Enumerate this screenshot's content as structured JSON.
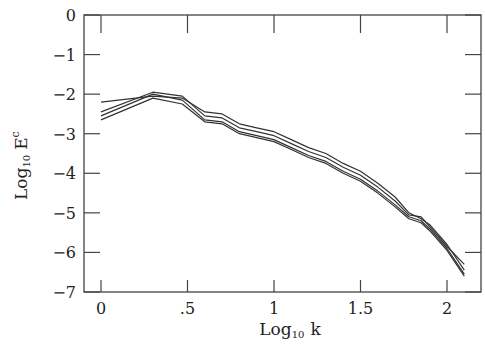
{
  "chart_data": {
    "type": "line",
    "title": "",
    "xlabel": "Log₁₀ k",
    "ylabel": "Log₁₀ E^c",
    "xlabel_main": "Log",
    "xlabel_sub": "10",
    "xlabel_var": "k",
    "ylabel_main": "Log",
    "ylabel_sub": "10",
    "ylabel_var": "E",
    "ylabel_sup": "c",
    "xlim": [
      -0.1,
      2.19
    ],
    "ylim": [
      -7,
      0
    ],
    "xticks": [
      0,
      0.5,
      1,
      1.5,
      2
    ],
    "xtick_labels": [
      "0",
      ".5",
      "1",
      "1.5",
      "2"
    ],
    "yticks": [
      0,
      -1,
      -2,
      -3,
      -4,
      -5,
      -6,
      -7
    ],
    "ytick_labels": [
      "0",
      "-1",
      "-2",
      "-3",
      "-4",
      "-5",
      "-6",
      "-7"
    ],
    "grid": false,
    "legend": null,
    "series": [
      {
        "name": "curve-1",
        "x": [
          0,
          0.3,
          0.47,
          0.6,
          0.7,
          0.8,
          0.9,
          1.0,
          1.1,
          1.2,
          1.3,
          1.4,
          1.5,
          1.6,
          1.7,
          1.78,
          1.85,
          1.9,
          2.0,
          2.1
        ],
        "y": [
          -2.2,
          -2.05,
          -2.1,
          -2.45,
          -2.5,
          -2.75,
          -2.85,
          -2.95,
          -3.15,
          -3.35,
          -3.5,
          -3.75,
          -3.95,
          -4.25,
          -4.6,
          -5.0,
          -5.15,
          -5.3,
          -5.8,
          -6.45
        ]
      },
      {
        "name": "curve-2",
        "x": [
          0,
          0.3,
          0.47,
          0.6,
          0.7,
          0.8,
          0.9,
          1.0,
          1.1,
          1.2,
          1.3,
          1.4,
          1.5,
          1.6,
          1.7,
          1.78,
          1.85,
          1.9,
          2.0,
          2.1
        ],
        "y": [
          -2.45,
          -1.95,
          -2.05,
          -2.55,
          -2.6,
          -2.85,
          -2.95,
          -3.05,
          -3.25,
          -3.45,
          -3.6,
          -3.85,
          -4.05,
          -4.35,
          -4.7,
          -5.05,
          -5.1,
          -5.35,
          -5.85,
          -6.3
        ]
      },
      {
        "name": "curve-3",
        "x": [
          0,
          0.3,
          0.47,
          0.6,
          0.7,
          0.8,
          0.9,
          1.0,
          1.1,
          1.2,
          1.3,
          1.4,
          1.5,
          1.6,
          1.7,
          1.78,
          1.85,
          1.9,
          2.0,
          2.1
        ],
        "y": [
          -2.55,
          -2.0,
          -2.15,
          -2.65,
          -2.7,
          -2.95,
          -3.05,
          -3.15,
          -3.35,
          -3.55,
          -3.7,
          -3.95,
          -4.15,
          -4.45,
          -4.8,
          -5.1,
          -5.2,
          -5.4,
          -5.9,
          -6.55
        ]
      },
      {
        "name": "curve-4",
        "x": [
          0,
          0.3,
          0.47,
          0.6,
          0.7,
          0.8,
          0.9,
          1.0,
          1.1,
          1.2,
          1.3,
          1.4,
          1.5,
          1.6,
          1.7,
          1.78,
          1.85,
          1.9,
          2.0,
          2.1
        ],
        "y": [
          -2.65,
          -2.1,
          -2.25,
          -2.7,
          -2.75,
          -3.0,
          -3.1,
          -3.2,
          -3.4,
          -3.6,
          -3.75,
          -4.0,
          -4.2,
          -4.5,
          -4.85,
          -5.15,
          -5.25,
          -5.45,
          -5.95,
          -6.6
        ]
      }
    ]
  },
  "layout": {
    "plot": {
      "left": 84,
      "top": 15,
      "right": 481,
      "bottom": 292
    },
    "x_px_per_unit": 173,
    "x_origin_px": 101,
    "y_px_per_unit": 39.57,
    "line_color": "#333333",
    "axis_color": "#444444"
  }
}
